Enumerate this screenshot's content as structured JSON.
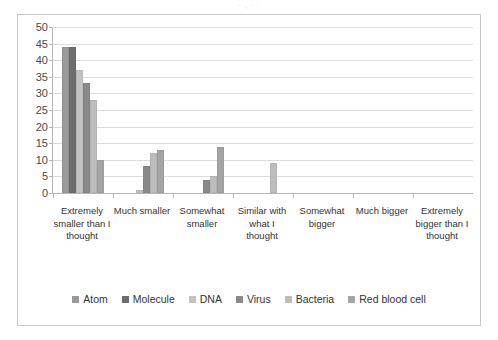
{
  "page": {
    "top_bleed_text": "·                 ,                        ·            ·"
  },
  "chart_data": {
    "type": "bar",
    "title": "",
    "subtitle": "",
    "xlabel": "",
    "ylabel": "",
    "ylim": [
      0,
      50
    ],
    "ytick_step": 5,
    "yticks": [
      "50",
      "45",
      "40",
      "35",
      "30",
      "25",
      "20",
      "15",
      "10",
      "5",
      "0"
    ],
    "grid": true,
    "legend_position": "bottom",
    "categories": [
      "Extremely smaller than I thought",
      "Much smaller",
      "Somewhat smaller",
      "Similar with what I thought",
      "Somewhat bigger",
      "Much bigger",
      "Extremely bigger than I thought"
    ],
    "series": [
      {
        "name": "Atom",
        "color": "#9a9a9a",
        "values": [
          44,
          0,
          0,
          0,
          0,
          0,
          0
        ]
      },
      {
        "name": "Molecule",
        "color": "#6e6e6e",
        "values": [
          44,
          0,
          0,
          0,
          0,
          0,
          0
        ]
      },
      {
        "name": "DNA",
        "color": "#c2c2c2",
        "values": [
          37,
          1,
          0,
          0,
          0,
          0,
          0
        ]
      },
      {
        "name": "Virus",
        "color": "#8a8a8a",
        "values": [
          33,
          8,
          4,
          0,
          0,
          0,
          0
        ]
      },
      {
        "name": "Bacteria",
        "color": "#bdbdbd",
        "values": [
          28,
          12,
          5,
          9,
          0,
          0,
          0
        ]
      },
      {
        "name": "Red blood cell",
        "color": "#a5a5a5",
        "values": [
          10,
          13,
          14,
          0,
          0,
          0,
          0
        ]
      }
    ]
  }
}
